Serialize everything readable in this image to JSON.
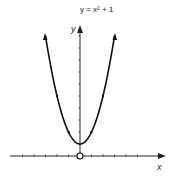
{
  "chart_data": {
    "type": "line",
    "title": "y = x² + 1",
    "xlabel": "x",
    "ylabel": "y",
    "series": [
      {
        "name": "y = x² + 1",
        "x": [
          -3,
          -2.5,
          -2,
          -1.5,
          -1,
          -0.5,
          0,
          0.5,
          1,
          1.5,
          2,
          2.5,
          3
        ],
        "values": [
          10,
          7.25,
          5,
          3.25,
          2,
          1.25,
          1,
          1.25,
          2,
          3.25,
          5,
          7.25,
          10
        ]
      }
    ],
    "xlim": [
      -6,
      7.5
    ],
    "ylim": [
      0,
      11
    ],
    "x_ticks": [
      -5,
      -4,
      -3,
      -2,
      -1,
      1,
      2,
      3,
      4,
      5
    ],
    "y_ticks": [
      1,
      2,
      3,
      4,
      5,
      6,
      7,
      8,
      9,
      10
    ],
    "annotations": [
      "open circle at origin",
      "direction arrows on curve"
    ],
    "grid": false,
    "legend": null
  },
  "labels": {
    "title": "y = x² + 1",
    "x_axis": "x",
    "y_axis": "y"
  },
  "colors": {
    "line": "#111111",
    "axis": "#222222",
    "background": "#ffffff"
  }
}
